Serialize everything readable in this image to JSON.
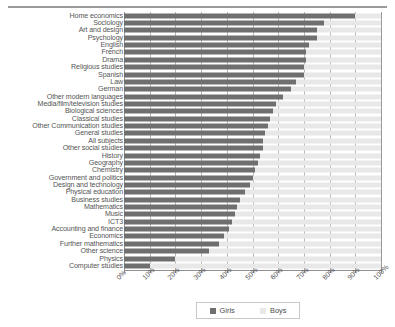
{
  "chart_data": {
    "type": "bar",
    "orientation": "horizontal",
    "stacked": true,
    "title": "",
    "subtitle": "",
    "xlabel": "",
    "ylabel": "",
    "xlim": [
      0,
      100
    ],
    "grid": true,
    "legend_position": "bottom",
    "xticks": [
      "0%",
      "10%",
      "20%",
      "30%",
      "40%",
      "50%",
      "60%",
      "70%",
      "80%",
      "90%",
      "100%"
    ],
    "xtick_values": [
      0,
      10,
      20,
      30,
      40,
      50,
      60,
      70,
      80,
      90,
      100
    ],
    "categories": [
      "Home economics",
      "Sociology",
      "Art and design",
      "Psychology",
      "English",
      "French",
      "Drama",
      "Religious studies",
      "Spanish",
      "Law",
      "German",
      "Other modern languages",
      "Media/film/television studies",
      "Biological sciences",
      "Classical studies",
      "Other Communication studies",
      "General studies",
      "All subjects",
      "Other social studies",
      "History",
      "Geography",
      "Chemistry",
      "Government and politics",
      "Design and technology",
      "Physical education",
      "Business studies",
      "Mathematics",
      "Music",
      "ICT3",
      "Accounting and finance",
      "Economics",
      "Further mathematics",
      "Other science",
      "Physics",
      "Computer studies"
    ],
    "series": [
      {
        "name": "Girls",
        "color": "#6f6f6f",
        "values": [
          90,
          78,
          75,
          75,
          72,
          71,
          71,
          70,
          70,
          67,
          65,
          62,
          59,
          58,
          57,
          56,
          55,
          54,
          54,
          53,
          52,
          51,
          50,
          49,
          47,
          45,
          44,
          43,
          42,
          41,
          39,
          37,
          33,
          20,
          10
        ]
      },
      {
        "name": "Boys",
        "color": "#e8e8e8",
        "values": [
          10,
          22,
          25,
          25,
          28,
          29,
          29,
          30,
          30,
          33,
          35,
          38,
          41,
          42,
          43,
          44,
          45,
          46,
          46,
          47,
          48,
          49,
          50,
          51,
          53,
          55,
          56,
          57,
          58,
          59,
          61,
          63,
          67,
          80,
          90
        ]
      }
    ]
  },
  "legend": {
    "items": [
      {
        "label": "Girls",
        "color": "#6f6f6f"
      },
      {
        "label": "Boys",
        "color": "#e8e8e8"
      }
    ]
  }
}
